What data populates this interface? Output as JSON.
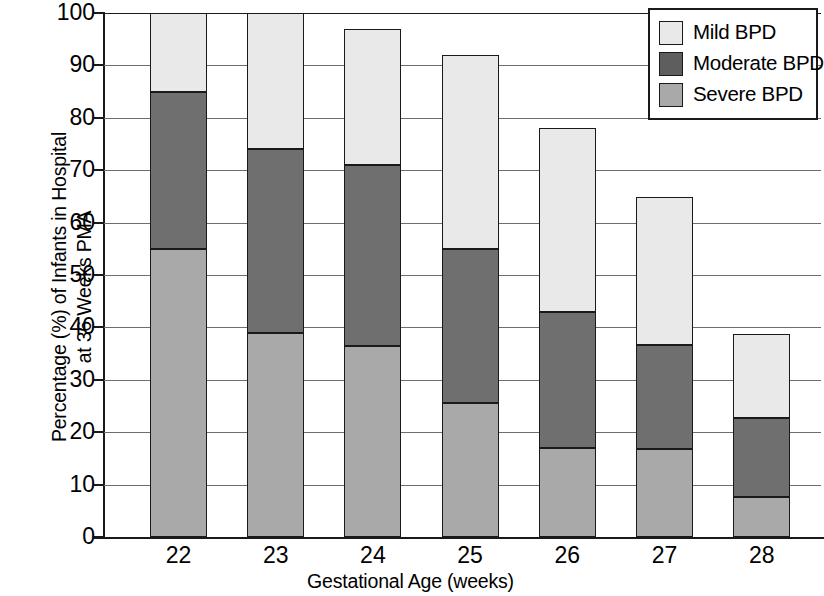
{
  "chart_data": {
    "type": "bar",
    "stacked": true,
    "title": "",
    "xlabel": "Gestational Age (weeks)",
    "ylabel": "Percentage (%) of Infants in Hospital\nat 36 Weeks PMA",
    "categories": [
      "22",
      "23",
      "24",
      "25",
      "26",
      "27",
      "28"
    ],
    "ylim": [
      0,
      100
    ],
    "yticks": [
      "100",
      "90",
      "80",
      "70",
      "60",
      "50",
      "40",
      "30",
      "20",
      "10",
      "0"
    ],
    "ytick_values": [
      100,
      90,
      80,
      70,
      60,
      50,
      40,
      30,
      20,
      10,
      0
    ],
    "grid": true,
    "grid_axis": "y",
    "legend_position": "top-right",
    "series": [
      {
        "name": "Mild BPD",
        "color": "#e9e9e9",
        "values": [
          15,
          26,
          26,
          37,
          35,
          28.2,
          16
        ]
      },
      {
        "name": "Moderate BPD",
        "color": "#6f6f6f",
        "values": [
          30,
          35,
          34.5,
          29.5,
          26,
          19.8,
          15
        ]
      },
      {
        "name": "Severe BPD",
        "color": "#a9a9a9",
        "values": [
          55,
          39,
          36.5,
          25.5,
          17,
          16.8,
          7.7
        ]
      }
    ],
    "cumulative_tops": {
      "severe": [
        55,
        39,
        36.5,
        25.5,
        17,
        16.8,
        7.7
      ],
      "moderate": [
        85,
        74,
        71,
        55,
        43,
        36.6,
        22.7
      ],
      "mild": [
        100,
        100,
        97,
        92,
        78,
        64.8,
        38.7
      ]
    },
    "totals": [
      100,
      100,
      97,
      92,
      78,
      64.8,
      38.7
    ]
  },
  "legend": {
    "items": [
      {
        "label": "Mild BPD",
        "key": "mild"
      },
      {
        "label": "Moderate BPD",
        "key": "moderate"
      },
      {
        "label": "Severe BPD",
        "key": "severe"
      }
    ]
  }
}
